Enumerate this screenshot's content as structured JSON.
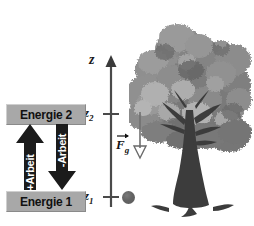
{
  "figure": {
    "background_color": "#ffffff",
    "width": 254,
    "height": 226
  },
  "energy_levels": {
    "upper": {
      "label": "Energie 2",
      "box_color": "#a8a8a8",
      "text_color": "#111111"
    },
    "lower": {
      "label": "Energie 1",
      "box_color": "#a8a8a8",
      "text_color": "#111111"
    }
  },
  "work_arrows": [
    {
      "name": "positive-work",
      "label": "+Arbeit",
      "direction": "up",
      "color": "#1a1a1a",
      "text_color": "#ffffff"
    },
    {
      "name": "negative-work",
      "label": "-Arbeit",
      "direction": "down",
      "color": "#1a1a1a",
      "text_color": "#ffffff"
    }
  ],
  "axis": {
    "name": "z-axis",
    "label": "z",
    "direction": "up",
    "color": "#444444",
    "ticks": [
      {
        "label": "z",
        "subscript": "2",
        "position": "upper"
      },
      {
        "label": "z",
        "subscript": "1",
        "position": "lower"
      }
    ]
  },
  "force_vector": {
    "symbol": "F",
    "subscript": "g",
    "direction": "down",
    "description": "gravitational force",
    "color": "#6f6f6f"
  },
  "ball": {
    "name": "ball",
    "color": "#636363"
  },
  "tree": {
    "name": "tree",
    "foliage_colors": [
      "#8e8e8e",
      "#7b7b7b",
      "#6b6b6b",
      "#a2a2a2",
      "#b4b4b4"
    ],
    "trunk_color": "#3a3a3a"
  }
}
